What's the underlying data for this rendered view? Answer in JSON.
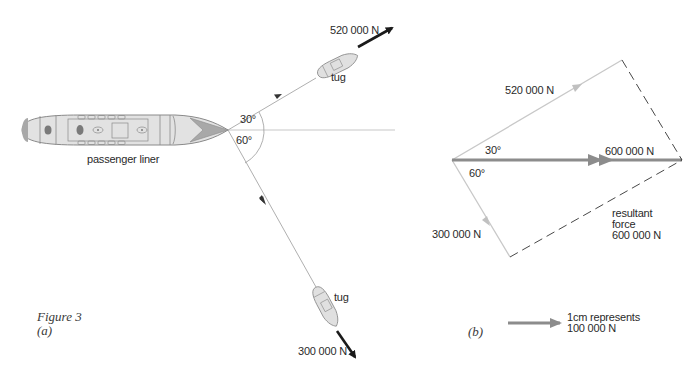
{
  "figure": {
    "caption": "Figure 3",
    "part_a_label": "(a)",
    "part_b_label": "(b)"
  },
  "part_a": {
    "liner_label": "passenger liner",
    "upper_tug": {
      "label": "tug",
      "force": "520 000 N",
      "angle": "30°"
    },
    "lower_tug": {
      "label": "tug",
      "force": "300 000 N",
      "angle": "60°"
    }
  },
  "part_b": {
    "upper_force": "520 000 N",
    "lower_force": "300 000 N",
    "upper_angle": "30°",
    "lower_angle": "60°",
    "resultant_on_line": "600 000 N",
    "resultant_label_line1": "resultant",
    "resultant_label_line2": "force",
    "resultant_label_line3": "600 000 N",
    "scale_line1": "1cm represents",
    "scale_line2": "100 000 N"
  },
  "colors": {
    "hull_fill": "#e2e2e2",
    "hull_stroke": "#8a8a8a",
    "bow_fill": "#a8a8a8",
    "dark_mark": "#7a7a7a",
    "thin_line": "#9a9a9a",
    "light_vector": "#c8c8c8",
    "resultant_vector": "#8c8c8c",
    "force_arrow": "#1a1a1a",
    "dash": "#333333"
  }
}
